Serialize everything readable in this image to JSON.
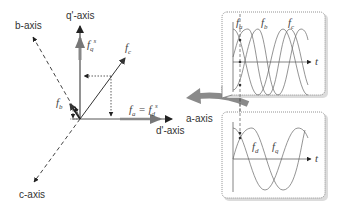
{
  "vector_diagram": {
    "axes": {
      "q_prime": "q'-axis",
      "b": "b-axis",
      "c": "c-axis",
      "a": "a-axis",
      "d_prime": "d'-axis"
    },
    "vectors": {
      "fq_main": "f",
      "fq_sub": "q",
      "fq_sup": "s",
      "fc_main": "f",
      "fc_sub": "c",
      "fb_main": "f",
      "fb_sub": "b",
      "fa_eq": "f",
      "fa_sub": "a",
      "fa_equals": " = ",
      "fd_main": "f",
      "fd_sub": "d",
      "fd_sup": "s"
    }
  },
  "panel_abc": {
    "labels": {
      "fa": "f",
      "fa_sub": "a",
      "fb": "f",
      "fb_sub": "b",
      "fc": "f",
      "fc_sub": "c",
      "t": "t"
    }
  },
  "panel_dq": {
    "labels": {
      "fd": "f",
      "fd_sub": "d",
      "fq": "f",
      "fq_sub": "q",
      "t": "t"
    }
  },
  "colors": {
    "axis": "#555555",
    "vector": "#333333",
    "thick_vector": "#777777",
    "arrow_gray": "#8a8a8a",
    "panel_border": "#999999",
    "curve": "#666666"
  }
}
